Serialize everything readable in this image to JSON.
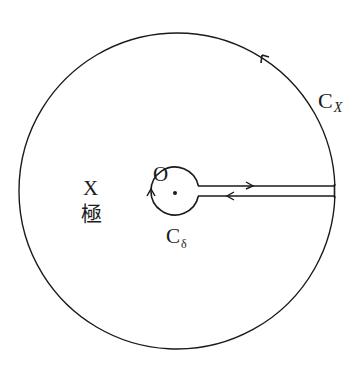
{
  "diagram": {
    "title": "",
    "type": "keyhole contour",
    "colors": {
      "stroke": "#1a1a1a",
      "background": "#ffffff"
    },
    "outer_circle": {
      "cx": 177,
      "cy": 192,
      "r": 158,
      "label_main": "C",
      "label_sub": "X",
      "direction": "counterclockwise"
    },
    "inner_circle": {
      "cx": 175,
      "cy": 191,
      "r": 24,
      "label_main": "C",
      "label_sub": "δ",
      "direction": "clockwise"
    },
    "branch_cut": {
      "y_upper": 186,
      "y_lower": 196,
      "x_start": 199,
      "x_end": 334,
      "upper_direction": "right",
      "lower_direction": "left"
    },
    "origin": {
      "label": "O",
      "x": 175,
      "y": 193
    },
    "annotations": {
      "x_label": "X",
      "kyoku_label": "極"
    }
  }
}
